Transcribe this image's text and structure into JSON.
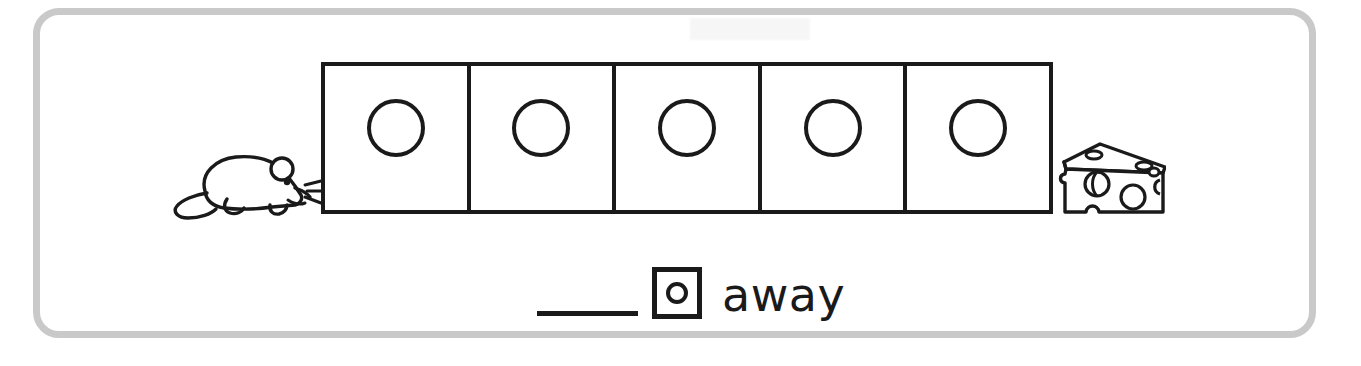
{
  "worksheet": {
    "title": "Mouse to cheese hop counting worksheet",
    "frame_color": "#c9c9c9",
    "ink_color": "#1a1a1a",
    "background_color": "#ffffff"
  },
  "path": {
    "start_icon": "mouse-icon",
    "end_icon": "cheese-icon",
    "box_count": 5,
    "boxes": [
      {
        "index": 1,
        "marker": "circle",
        "value": ""
      },
      {
        "index": 2,
        "marker": "circle",
        "value": ""
      },
      {
        "index": 3,
        "marker": "circle",
        "value": ""
      },
      {
        "index": 4,
        "marker": "circle",
        "value": ""
      },
      {
        "index": 5,
        "marker": "circle",
        "value": ""
      }
    ]
  },
  "answer": {
    "blank_value": "",
    "unit_icon": "box-with-circle-icon",
    "unit_label": "away"
  }
}
